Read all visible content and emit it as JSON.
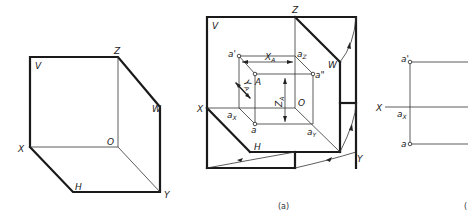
{
  "figure_left": {
    "labels": {
      "V": "V",
      "Z": "Z",
      "W": "W",
      "X": "X",
      "O": "O",
      "H": "H",
      "Y": "Y"
    }
  },
  "figure_middle": {
    "labels": {
      "V": "V",
      "Z": "Z",
      "W": "W",
      "X": "X",
      "O": "O",
      "H": "H",
      "Y": "Y",
      "a_prime": "a'",
      "a_Z": "a",
      "a_Z_sub": "Z",
      "a_dprime": "a\"",
      "A": "A",
      "a_X": "a",
      "a_X_sub": "X",
      "a": "a",
      "a_Y": "a",
      "a_Y_sub": "Y",
      "X_A": "X",
      "X_A_sub": "A",
      "Y_A": "Y",
      "Y_A_sub": "A",
      "Z_A": "Z",
      "Z_A_sub": "A"
    },
    "caption": "(a)"
  },
  "figure_right": {
    "labels": {
      "X": "X",
      "a_prime": "a'",
      "a_X": "a",
      "a_X_sub": "X",
      "a": "a"
    },
    "caption_partial": "("
  }
}
